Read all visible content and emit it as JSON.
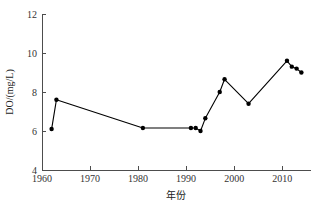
{
  "chart_data": {
    "type": "line",
    "title": "",
    "xlabel": "年份",
    "ylabel": "DO/(mg/L)",
    "xlim": [
      1960,
      2016
    ],
    "ylim": [
      4,
      12
    ],
    "xticks": [
      1960,
      1970,
      1980,
      1990,
      2000,
      2010
    ],
    "xtick_labels": [
      "1960",
      "1970",
      "1980",
      "1990",
      "2000",
      "2010"
    ],
    "yticks": [
      4,
      6,
      8,
      10,
      12
    ],
    "ytick_labels": [
      "4",
      "6",
      "8",
      "10",
      "12"
    ],
    "grid": false,
    "legend": null,
    "marker": "filled-circle",
    "line_color": "#000000",
    "marker_color": "#000000",
    "axis_color": "#4d4d4d",
    "background_color": "#ffffff",
    "x": [
      1962,
      1963,
      1981,
      1991,
      1992,
      1993,
      1994,
      1997,
      1998,
      2003,
      2011,
      2012,
      2013,
      2014
    ],
    "values": [
      6.1,
      7.6,
      6.15,
      6.15,
      6.15,
      6.0,
      6.65,
      8.0,
      8.65,
      7.4,
      9.6,
      9.3,
      9.2,
      9.0
    ],
    "series": [
      {
        "name": "DO",
        "points": [
          {
            "x": 1962,
            "y": 6.1
          },
          {
            "x": 1963,
            "y": 7.6
          },
          {
            "x": 1981,
            "y": 6.15
          },
          {
            "x": 1991,
            "y": 6.15
          },
          {
            "x": 1992,
            "y": 6.15
          },
          {
            "x": 1993,
            "y": 6.0
          },
          {
            "x": 1994,
            "y": 6.65
          },
          {
            "x": 1997,
            "y": 8.0
          },
          {
            "x": 1998,
            "y": 8.65
          },
          {
            "x": 2003,
            "y": 7.4
          },
          {
            "x": 2011,
            "y": 9.6
          },
          {
            "x": 2012,
            "y": 9.3
          },
          {
            "x": 2013,
            "y": 9.2
          },
          {
            "x": 2014,
            "y": 9.0
          }
        ]
      }
    ]
  },
  "axis_labels": {
    "x_title": "年份",
    "y_title": "DO/(mg/L)"
  }
}
